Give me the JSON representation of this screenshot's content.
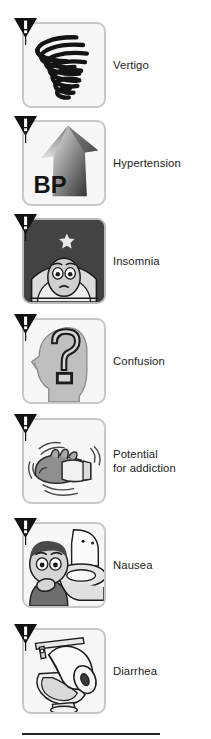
{
  "page": {
    "background_color": "#ffffff",
    "text_color": "#1b1b1b",
    "panel_border_color": "#c8c8c8",
    "panel_background_color": "#f7f7f7",
    "rule_color": "#242424"
  },
  "warning_badge": {
    "icon": "warning-triangle-icon",
    "shape": "inverted-triangle",
    "symbol": "!",
    "fill_color": "#111111",
    "symbol_color": "#ffffff"
  },
  "items": [
    {
      "label": "Vertigo",
      "icon": "spiral-vertigo-icon",
      "panel_style": "light",
      "art_description": "black spiral / vortex coil"
    },
    {
      "label": "Hypertension",
      "icon": "blood-pressure-up-arrow-icon",
      "panel_style": "light",
      "art_description": "large upward gray gradient arrow",
      "art_text": "BP"
    },
    {
      "label": "Insomnia",
      "icon": "sleepless-face-moon-icon",
      "panel_style": "dark",
      "art_description": "awake face on pillow with crescent moon and star on dark night sky"
    },
    {
      "label": "Confusion",
      "icon": "head-question-mark-icon",
      "panel_style": "light",
      "art_description": "gray head profile silhouette containing a large question mark",
      "art_text": "?"
    },
    {
      "label": "Potential\nfor addiction",
      "icon": "shaking-hand-pill-bottle-icon",
      "panel_style": "light",
      "art_description": "trembling hand gripping a pill bottle with motion lines"
    },
    {
      "label": "Nausea",
      "icon": "nausea-person-toilet-icon",
      "panel_style": "light",
      "art_description": "person with hand over mouth kneeling beside an open toilet"
    },
    {
      "label": "Diarrhea",
      "icon": "toilet-paper-roll-icon",
      "panel_style": "light",
      "art_description": "toilet with an oversized toilet paper roll"
    }
  ]
}
